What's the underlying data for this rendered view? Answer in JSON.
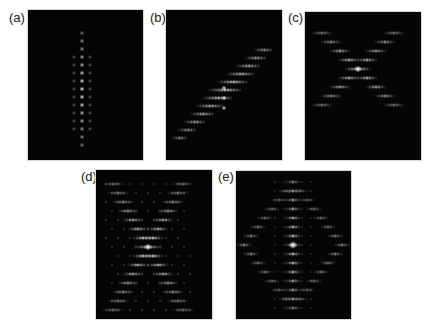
{
  "figure": {
    "background": "#ffffff",
    "panel_background": "#050505",
    "spot_color": "#ffffff",
    "panels": [
      {
        "id": "a",
        "label": "(a)",
        "label_pos": [
          9,
          11
        ],
        "rect": [
          28,
          10,
          115,
          150
        ],
        "pattern": "vertical-line",
        "spots": {
          "center_x": 54,
          "y_start": 23,
          "y_end": 137,
          "step": 8,
          "side_offset": 8,
          "side_rows": [
            6,
            14
          ]
        }
      },
      {
        "id": "b",
        "label": "(b)",
        "label_pos": [
          150,
          11
        ],
        "rect": [
          166,
          10,
          116,
          150
        ],
        "pattern": "diagonal-line",
        "spots": {
          "start": [
            14,
            128
          ],
          "end": [
            98,
            40
          ],
          "rows": 12,
          "row_width": 12
        }
      },
      {
        "id": "c",
        "label": "(c)",
        "label_pos": [
          288,
          11
        ],
        "rect": [
          305,
          12,
          116,
          148
        ],
        "pattern": "x-cross",
        "spots": {
          "center": [
            53,
            57
          ],
          "rows": 9,
          "row_step": 9,
          "arm_spread": 9
        }
      },
      {
        "id": "d",
        "label": "(d)",
        "label_pos": [
          81,
          170
        ],
        "rect": [
          96,
          170,
          116,
          149
        ],
        "pattern": "dense-x",
        "spots": {
          "center": [
            52,
            77
          ],
          "rows": 15,
          "row_step": 9,
          "arm_spread": 5
        }
      },
      {
        "id": "e",
        "label": "(e)",
        "label_pos": [
          218,
          170
        ],
        "rect": [
          236,
          171,
          115,
          148
        ],
        "pattern": "diamond",
        "spots": {
          "center": [
            57,
            74
          ],
          "rows": 15,
          "row_step": 9
        }
      }
    ]
  }
}
